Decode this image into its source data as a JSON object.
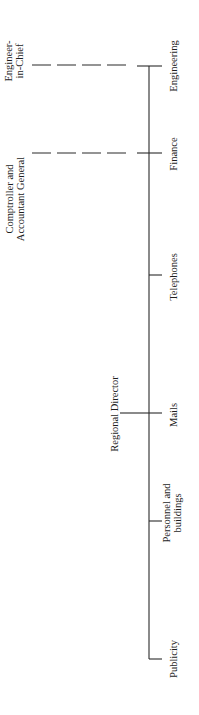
{
  "diagram": {
    "type": "organization-chart",
    "orientation": "rotated-90-ccw",
    "colors": {
      "background": "#ffffff",
      "line": "#2a2a2a",
      "text": "#1e1e1e"
    },
    "spine": {
      "x": 149,
      "y_top": 66,
      "y_bottom": 659
    },
    "head": {
      "id": "regional-director",
      "lines": [
        "Regional Director"
      ],
      "x": 114,
      "y": 414,
      "connector": {
        "x1": 120,
        "x2": 149,
        "y": 413
      }
    },
    "departments": [
      {
        "id": "engineering",
        "lines": [
          "Engineering"
        ],
        "tick_y": 66,
        "tick_x1": 137,
        "tick_x2": 162,
        "label_x": 173,
        "label_y": 66
      },
      {
        "id": "finance",
        "lines": [
          "Finance"
        ],
        "tick_y": 153,
        "tick_x1": 137,
        "tick_x2": 162,
        "label_x": 173,
        "label_y": 154
      },
      {
        "id": "telephones",
        "lines": [
          "Telephones"
        ],
        "tick_y": 275,
        "tick_x1": 149,
        "tick_x2": 162,
        "label_x": 173,
        "label_y": 277
      },
      {
        "id": "mails",
        "lines": [
          "Mails"
        ],
        "tick_y": 413,
        "tick_x1": 149,
        "tick_x2": 162,
        "label_x": 173,
        "label_y": 415
      },
      {
        "id": "personnel-and-buildings",
        "lines": [
          "Personnel and",
          "buildings"
        ],
        "tick_y": 521,
        "tick_x1": 149,
        "tick_x2": 162,
        "label_x": 172,
        "label_y": 513
      },
      {
        "id": "publicity",
        "lines": [
          "Publicity"
        ],
        "tick_y": 659,
        "tick_x1": 149,
        "tick_x2": 162,
        "label_x": 173,
        "label_y": 659
      }
    ],
    "external_authorities": [
      {
        "id": "engineer-in-chief",
        "lines": [
          "Engineer-",
          "in-Chief"
        ],
        "label_x": 14,
        "label_y": 61,
        "dashed_link": {
          "x1": 32,
          "x2": 128,
          "y": 65,
          "target": "engineering"
        }
      },
      {
        "id": "comptroller-and-accountant-general",
        "lines": [
          "Comptroller and",
          "Accountant General"
        ],
        "label_x": 15,
        "label_y": 199,
        "dashed_link": {
          "x1": 32,
          "x2": 128,
          "y": 153,
          "target": "finance"
        }
      }
    ]
  }
}
